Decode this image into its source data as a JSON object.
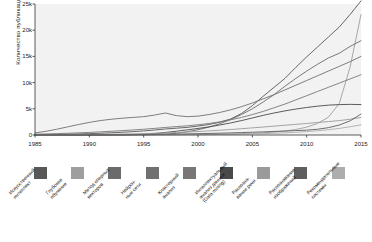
{
  "chart_data": {
    "type": "line",
    "title": "",
    "xlabel": "",
    "ylabel": "Количество публикаций",
    "xlim": [
      1985,
      2015
    ],
    "ylim": [
      0,
      25000
    ],
    "grid": false,
    "legend_position": "bottom",
    "xticks": [
      "1985",
      "1990",
      "1995",
      "2000",
      "2005",
      "2010",
      "2015"
    ],
    "xtick_values": [
      1985,
      1990,
      1995,
      2000,
      2005,
      2010,
      2015
    ],
    "yticks": [
      "0",
      "5k",
      "10k",
      "15k",
      "20k",
      "25k"
    ],
    "ytick_values": [
      0,
      5000,
      10000,
      15000,
      20000,
      25000
    ],
    "x": [
      1985,
      1986,
      1987,
      1988,
      1989,
      1990,
      1991,
      1992,
      1993,
      1994,
      1995,
      1996,
      1997,
      1998,
      1999,
      2000,
      2001,
      2002,
      2003,
      2004,
      2005,
      2006,
      2007,
      2008,
      2009,
      2010,
      2011,
      2012,
      2013,
      2014,
      2015
    ],
    "series": [
      {
        "name": "Искусственный интеллект",
        "label": "Искусственный\nинтеллект",
        "color": "#585858",
        "values": [
          60,
          80,
          110,
          150,
          200,
          260,
          330,
          420,
          520,
          640,
          780,
          950,
          1150,
          1300,
          1450,
          1700,
          2000,
          2450,
          3050,
          4100,
          5600,
          7400,
          9100,
          10800,
          12900,
          14900,
          16800,
          18700,
          20600,
          23000,
          25600
        ]
      },
      {
        "name": "Глубокое обучение",
        "label": "Глубокое\nобучение",
        "color": "#9e9e9e",
        "values": [
          5,
          6,
          8,
          10,
          13,
          16,
          20,
          25,
          30,
          38,
          46,
          56,
          68,
          80,
          95,
          115,
          140,
          170,
          210,
          260,
          330,
          420,
          560,
          760,
          1050,
          1500,
          2200,
          3400,
          6000,
          13000,
          23000
        ]
      },
      {
        "name": "Метод опорных векторов",
        "label": "Метод опорных\nвекторов",
        "color": "#6b6b6b",
        "values": [
          2,
          3,
          4,
          5,
          7,
          9,
          12,
          16,
          22,
          30,
          45,
          80,
          160,
          330,
          620,
          1000,
          1500,
          2150,
          2950,
          3900,
          5000,
          6300,
          7700,
          9300,
          10800,
          12200,
          13500,
          14700,
          15600,
          16900,
          18000
        ]
      },
      {
        "name": "Нейронные сети",
        "label": "Нейрон-\nные сети",
        "color": "#707070",
        "values": [
          400,
          700,
          1100,
          1550,
          2000,
          2400,
          2750,
          3000,
          3200,
          3350,
          3500,
          3800,
          4200,
          3700,
          3500,
          3600,
          3900,
          4300,
          4800,
          5400,
          6100,
          6900,
          7700,
          8600,
          9500,
          10400,
          11300,
          12200,
          13100,
          14000,
          15000
        ]
      },
      {
        "name": "Кластерный анализ",
        "label": "Кластерный\nанализ",
        "color": "#777777",
        "values": [
          150,
          200,
          260,
          330,
          410,
          500,
          600,
          710,
          830,
          960,
          1100,
          1260,
          1440,
          1600,
          1750,
          1950,
          2200,
          2500,
          2900,
          3350,
          3900,
          4500,
          5200,
          5900,
          6700,
          7500,
          8300,
          9100,
          9900,
          10700,
          11500
        ]
      },
      {
        "name": "Интеллектуальный анализ данных (Data mining)",
        "label": "Интеллектуальный\nанализ данных\n(Data mining)",
        "color": "#4a4a4a",
        "values": [
          3,
          4,
          5,
          7,
          9,
          12,
          18,
          28,
          45,
          80,
          150,
          280,
          480,
          720,
          980,
          1250,
          1550,
          1900,
          2300,
          2750,
          3250,
          3750,
          4200,
          4600,
          4950,
          5250,
          5500,
          5700,
          5800,
          5850,
          5800
        ]
      },
      {
        "name": "Распознавание речи",
        "label": "Распозна-\nвание речи",
        "color": "#9a9a9a",
        "values": [
          20,
          28,
          38,
          50,
          65,
          85,
          110,
          140,
          175,
          215,
          260,
          320,
          390,
          470,
          560,
          660,
          780,
          910,
          1050,
          1200,
          1360,
          1520,
          1690,
          1860,
          2030,
          2200,
          2380,
          2560,
          2750,
          3000,
          3350
        ]
      },
      {
        "name": "Распознавание изображений",
        "label": "Распознавание\nизображений",
        "color": "#5f5f5f",
        "values": [
          10,
          13,
          17,
          22,
          28,
          35,
          44,
          55,
          68,
          84,
          102,
          124,
          150,
          180,
          215,
          255,
          300,
          350,
          405,
          465,
          530,
          600,
          675,
          755,
          840,
          930,
          1100,
          1400,
          1900,
          2700,
          4000
        ]
      },
      {
        "name": "Рекомендательные системы",
        "label": "Рекомендательные\nсистемы",
        "color": "#adadad",
        "values": [
          1,
          1,
          2,
          2,
          3,
          4,
          5,
          7,
          9,
          12,
          16,
          21,
          28,
          36,
          47,
          60,
          78,
          100,
          128,
          163,
          207,
          262,
          330,
          415,
          520,
          650,
          810,
          1010,
          1260,
          1570,
          1950
        ]
      }
    ]
  }
}
